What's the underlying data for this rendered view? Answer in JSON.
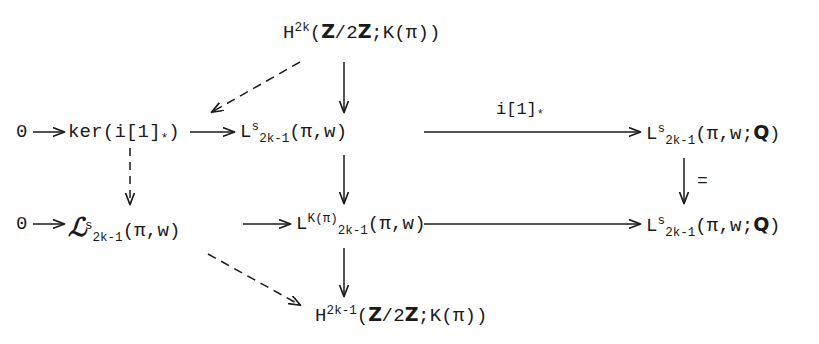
{
  "diagram": {
    "type": "commutative-diagram",
    "background_color": "#ffffff",
    "ink_color": "#1a1a1a",
    "nodes": {
      "top_cohomology": {
        "base": "H",
        "sup": "2k",
        "args": "(",
        "z1": "Z",
        "slash": "/2",
        "z2": "Z",
        "tail": ";K(π))"
      },
      "zero_top": "0",
      "kernel": "ker(i[1]",
      "kernel_star": "*",
      "kernel_close": ")",
      "l_s_mid": {
        "base": "L",
        "sup": "s",
        "sub": "2k-1",
        "args": "(π,w)"
      },
      "l_s_q_top": {
        "base": "L",
        "sup": "s",
        "sub": "2k-1",
        "args": "(π,w;",
        "q": "Q",
        "close": ")"
      },
      "zero_bottom": "0",
      "script_l": {
        "base": "ℒ",
        "sup": "s",
        "sub": "2k-1",
        "args": "(π,w)"
      },
      "l_kpi": {
        "base": "L",
        "sup": "K(π)",
        "sub": "2k-1",
        "args": "(π,w)"
      },
      "l_s_q_bottom": {
        "base": "L",
        "sup": "s",
        "sub": "2k-1",
        "args": "(π,w;",
        "q": "Q",
        "close": ")"
      },
      "bottom_cohomology": {
        "base": "H",
        "sup": "2k-1",
        "args": "(",
        "z1": "Z",
        "slash": "/2",
        "z2": "Z",
        "tail": ";K(π))"
      }
    },
    "arrow_labels": {
      "i_one_star": "i[1]",
      "i_one_star_sub": "*",
      "identity": "="
    }
  }
}
